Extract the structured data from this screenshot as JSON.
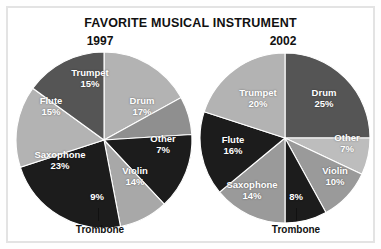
{
  "chart_data": {
    "type": "pie",
    "title": "FAVORITE MUSICAL INSTRUMENT",
    "xlabel": "",
    "ylabel": "",
    "legend": "none",
    "grid": false,
    "charts": [
      {
        "name": "1997",
        "categories": [
          "Drum",
          "Other",
          "Violin",
          "Trombone",
          "Saxophone",
          "Flute",
          "Trumpet"
        ],
        "values": [
          17,
          7,
          14,
          9,
          23,
          15,
          15
        ],
        "unit": "%",
        "colors": [
          "#b3b3b3",
          "#8f8f8f",
          "#1c1c1c",
          "#a8a8a8",
          "#1c1c1c",
          "#b3b3b3",
          "#555555"
        ]
      },
      {
        "name": "2002",
        "categories": [
          "Drum",
          "Other",
          "Violin",
          "Trombone",
          "Saxophone",
          "Flute",
          "Trumpet"
        ],
        "values": [
          25,
          7,
          10,
          8,
          14,
          16,
          20
        ],
        "unit": "%",
        "colors": [
          "#555555",
          "#bdbdbd",
          "#9a9a9a",
          "#1c1c1c",
          "#9a9a9a",
          "#1c1c1c",
          "#b3b3b3"
        ]
      }
    ]
  },
  "title": "FAVORITE MUSICAL INSTRUMENT",
  "left": {
    "year": "1997",
    "labels": {
      "trumpet_name": "Trumpet",
      "trumpet_pct": "15%",
      "drum_name": "Drum",
      "drum_pct": "17%",
      "other_name": "Other",
      "other_pct": "7%",
      "violin_name": "Violin",
      "violin_pct": "14%",
      "trombone_pct": "9%",
      "trombone_name": "Trombone",
      "saxophone_name": "Saxophone",
      "saxophone_pct": "23%",
      "flute_name": "Flute",
      "flute_pct": "15%"
    }
  },
  "right": {
    "year": "2002",
    "labels": {
      "trumpet_name": "Trumpet",
      "trumpet_pct": "20%",
      "drum_name": "Drum",
      "drum_pct": "25%",
      "other_name": "Other",
      "other_pct": "7%",
      "violin_name": "Violin",
      "violin_pct": "10%",
      "trombone_pct": "8%",
      "trombone_name": "Trombone",
      "saxophone_name": "Saxophone",
      "saxophone_pct": "14%",
      "flute_name": "Flute",
      "flute_pct": "16%"
    }
  }
}
